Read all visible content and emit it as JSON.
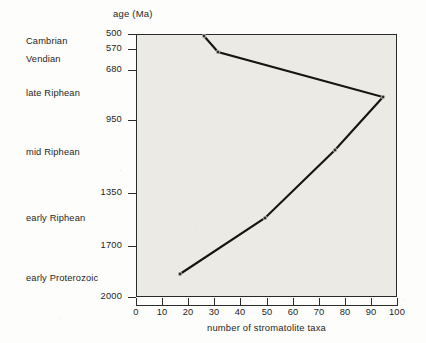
{
  "figure": {
    "y_axis_title": "age (Ma)",
    "x_axis_title": "number of  stromatolite taxa"
  },
  "era_labels": [
    {
      "name": "Cambrian",
      "age_ma": 510,
      "top_px": 36
    },
    {
      "name": "Vendian",
      "age_ma": 545,
      "top_px": 54
    },
    {
      "name": "late Riphean",
      "age_ma": 800,
      "top_px": 88
    },
    {
      "name": "mid Riphean",
      "age_ma": 1150,
      "top_px": 147
    },
    {
      "name": "early Riphean",
      "age_ma": 1500,
      "top_px": 213
    },
    {
      "name": "early Proterozoic",
      "age_ma": 1900,
      "top_px": 273
    }
  ],
  "y_ticks": [
    {
      "label": "500",
      "top_px": 34
    },
    {
      "label": "570",
      "top_px": 49
    },
    {
      "label": "680",
      "top_px": 70
    },
    {
      "label": "950",
      "top_px": 120
    },
    {
      "label": "1350",
      "top_px": 193
    },
    {
      "label": "1700",
      "top_px": 246
    },
    {
      "label": "2000",
      "top_px": 297
    }
  ],
  "x_ticks": [
    {
      "label": "0",
      "left_px": 136
    },
    {
      "label": "10",
      "left_px": 162
    },
    {
      "label": "20",
      "left_px": 188
    },
    {
      "label": "30",
      "left_px": 214
    },
    {
      "label": "40",
      "left_px": 240
    },
    {
      "label": "50",
      "left_px": 267
    },
    {
      "label": "60",
      "left_px": 293
    },
    {
      "label": "70",
      "left_px": 319
    },
    {
      "label": "80",
      "left_px": 345
    },
    {
      "label": "90",
      "left_px": 371
    },
    {
      "label": "100",
      "left_px": 397
    }
  ],
  "chart_data": {
    "type": "line",
    "title": "",
    "xlabel": "number of  stromatolite taxa",
    "ylabel": "age (Ma)",
    "xlim": [
      0,
      100
    ],
    "ylim": [
      2000,
      500
    ],
    "y_axis_inverted": true,
    "y_axis_scale": "nonlinear (geological stage boundaries)",
    "y_tick_values": [
      500,
      570,
      680,
      950,
      1350,
      1700,
      2000
    ],
    "x_tick_values": [
      0,
      10,
      20,
      30,
      40,
      50,
      60,
      70,
      80,
      90,
      100
    ],
    "grid": false,
    "legend": "none",
    "series": [
      {
        "name": "stromatolite taxa",
        "points": [
          {
            "age_ma": 500,
            "taxa": 25,
            "px": [
              204,
              36
            ]
          },
          {
            "age_ma": 570,
            "taxa": 31,
            "px": [
              218,
              52
            ]
          },
          {
            "age_ma": 800,
            "taxa": 95,
            "px": [
              383,
              97
            ]
          },
          {
            "age_ma": 1150,
            "taxa": 76,
            "px": [
              335,
              150
            ]
          },
          {
            "age_ma": 1550,
            "taxa": 46,
            "px": [
              265,
              218
            ]
          },
          {
            "age_ma": 1900,
            "taxa": 17,
            "px": [
              180,
              274
            ]
          }
        ]
      }
    ]
  }
}
